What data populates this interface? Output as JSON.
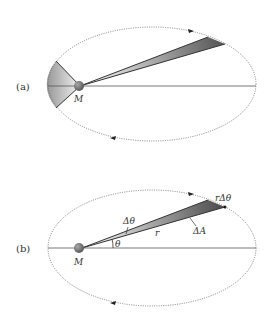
{
  "panel_a": {
    "label": "(a)",
    "mass_label": "M"
  },
  "panel_b": {
    "label": "(b)",
    "mass_label": "M",
    "angle_label": "θ",
    "delta_theta_label": "Δθ",
    "radius_label": "r",
    "arc_label": "rΔθ",
    "area_label": "ΔA"
  },
  "colors": {
    "orbit": "#666666",
    "axis": "#555555",
    "planet": "#7a7a7a",
    "wedge_dark": "#555555",
    "wedge_light": "#f4f4f4"
  }
}
